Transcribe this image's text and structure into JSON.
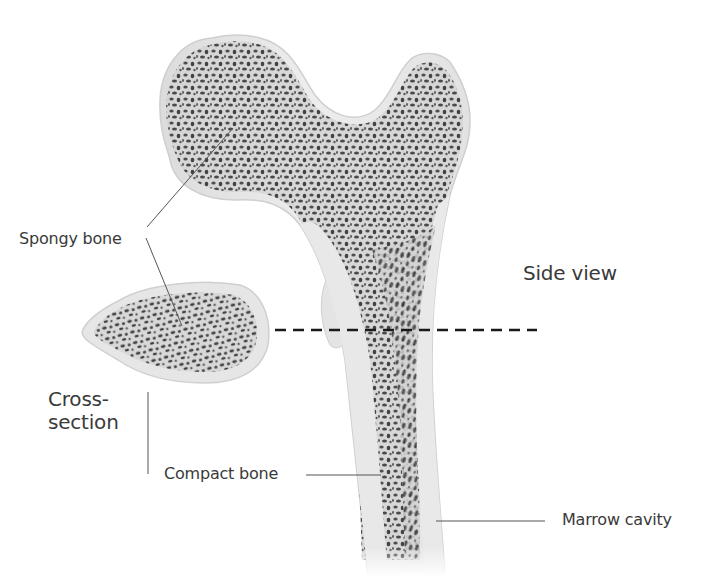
{
  "figure": {
    "clipped_title": "",
    "labels": {
      "spongy_bone": "Spongy bone",
      "side_view": "Side view",
      "cross_section_line1": "Cross-",
      "cross_section_line2": "section",
      "compact_bone": "Compact bone",
      "marrow_cavity": "Marrow cavity"
    },
    "colors": {
      "background": "#ffffff",
      "compact_bone": "#e6e6e6",
      "compact_bone_edge": "#cfcfcf",
      "spongy_fill": "#d9d9d9",
      "pore": "#3a3a3a",
      "leader_line": "#555555",
      "dashed_line": "#1a1a1a",
      "label_text": "#3a3a3a"
    },
    "section_line": {
      "style": "dashed",
      "y": 330,
      "x_start": 275,
      "x_end": 537
    }
  }
}
